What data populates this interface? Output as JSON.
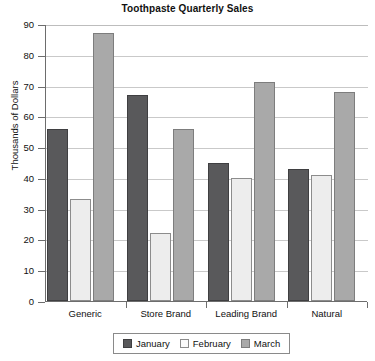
{
  "chart_data": {
    "type": "bar",
    "title": "Toothpaste Quarterly Sales",
    "xlabel": "",
    "ylabel": "Thousands of Dollars",
    "categories": [
      "Generic",
      "Store Brand",
      "Leading Brand",
      "Natural"
    ],
    "series": [
      {
        "name": "January",
        "color": "#59595b",
        "values": [
          56,
          67,
          45,
          43
        ]
      },
      {
        "name": "February",
        "color": "#ededed",
        "values": [
          33,
          22,
          40,
          41
        ]
      },
      {
        "name": "March",
        "color": "#a9a9a9",
        "values": [
          87,
          56,
          71,
          68
        ]
      }
    ],
    "ylim": [
      0,
      90
    ],
    "yticks": [
      0,
      10,
      20,
      30,
      40,
      50,
      60,
      70,
      80,
      90
    ],
    "ytick_labels": [
      "0",
      "10",
      "20",
      "30",
      "40",
      "50",
      "60",
      "70",
      "80",
      "90"
    ],
    "grid": true,
    "legend_position": "bottom"
  }
}
